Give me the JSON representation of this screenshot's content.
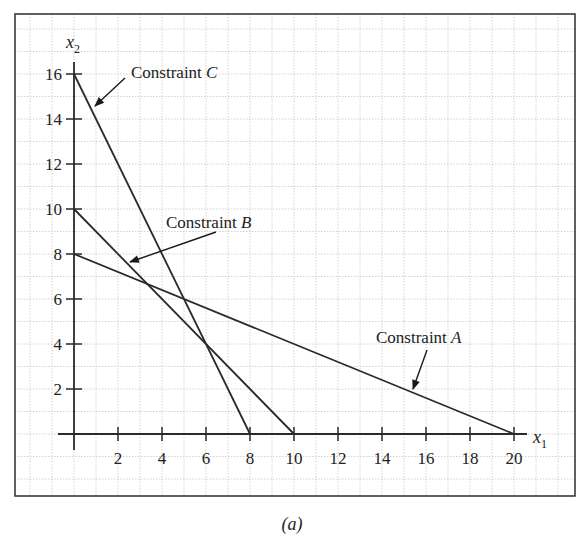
{
  "chart_data": {
    "type": "line",
    "title": "",
    "xlabel": "x1",
    "ylabel": "x2",
    "xlim": [
      0,
      20
    ],
    "ylim": [
      0,
      16
    ],
    "x_ticks": [
      2,
      4,
      6,
      8,
      10,
      12,
      14,
      16,
      18,
      20
    ],
    "y_ticks": [
      2,
      4,
      6,
      8,
      10,
      12,
      14,
      16
    ],
    "grid": true,
    "legend": "none",
    "series": [
      {
        "name": "Constraint A",
        "points": [
          [
            0,
            8
          ],
          [
            20,
            0
          ]
        ]
      },
      {
        "name": "Constraint B",
        "points": [
          [
            0,
            10
          ],
          [
            10,
            0
          ]
        ]
      },
      {
        "name": "Constraint C",
        "points": [
          [
            0,
            16
          ],
          [
            8,
            0
          ]
        ]
      }
    ],
    "annotations": [
      {
        "text": "Constraint A",
        "points_to": [
          15.1,
          2.45
        ]
      },
      {
        "text": "Constraint B",
        "points_to": [
          2.4,
          7.6
        ]
      },
      {
        "text": "Constraint C",
        "points_to": [
          0.9,
          14.2
        ]
      }
    ],
    "caption": "(a)"
  },
  "axes": {
    "x_name": "x",
    "x_sub": "1",
    "y_name": "x",
    "y_sub": "2"
  },
  "annotations": {
    "a_prefix": "Constraint ",
    "a_letter": "A",
    "b_prefix": "Constraint ",
    "b_letter": "B",
    "c_prefix": "Constraint ",
    "c_letter": "C"
  },
  "caption": "(a)",
  "colors": {
    "line": "#2a2a2a",
    "grid": "#c8c8c8",
    "frame": "#3a3a3a"
  }
}
